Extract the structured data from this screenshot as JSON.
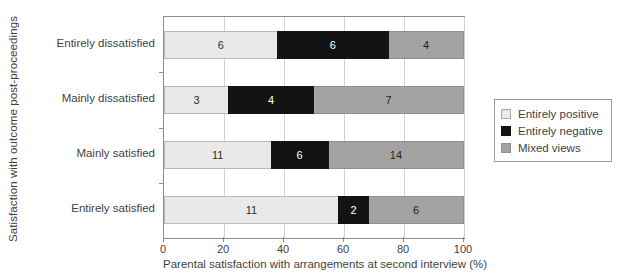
{
  "chart_data": {
    "type": "bar",
    "orientation": "horizontal",
    "stacked": true,
    "stack_unit": "count",
    "title": "",
    "xlabel": "Parental satisfaction with arrangements at second interview (%)",
    "ylabel": "Satisfaction with outcome post-proceedings",
    "xlim": [
      0,
      100
    ],
    "xticks": [
      0,
      20,
      40,
      60,
      80,
      100
    ],
    "xtick_labels": [
      "0",
      "20",
      "40",
      "60",
      "80",
      "100"
    ],
    "grid": true,
    "legend_position": "right",
    "categories": [
      "Entirely dissatisfied",
      "Mainly dissatisfied",
      "Mainly satisfied",
      "Entirely satisfied"
    ],
    "series": [
      {
        "name": "Entirely positive",
        "color": "#e9e9e9",
        "values": [
          6,
          3,
          11,
          11
        ]
      },
      {
        "name": "Entirely negative",
        "color": "#131313",
        "values": [
          6,
          4,
          6,
          2
        ]
      },
      {
        "name": "Mixed views",
        "color": "#a3a3a3",
        "values": [
          4,
          7,
          14,
          6
        ]
      }
    ],
    "bar_labels": [
      [
        "6",
        "6",
        "4"
      ],
      [
        "3",
        "4",
        "7"
      ],
      [
        "11",
        "6",
        "14"
      ],
      [
        "11",
        "2",
        "6"
      ]
    ],
    "row_totals": [
      16,
      14,
      31,
      19
    ],
    "percent_segments": [
      [
        37.5,
        37.5,
        25.0
      ],
      [
        21.4,
        28.6,
        50.0
      ],
      [
        35.5,
        19.4,
        45.2
      ],
      [
        57.9,
        10.5,
        31.6
      ]
    ]
  },
  "legend": {
    "items": [
      {
        "label": "Entirely positive",
        "swatch": "swatch-entirely-positive"
      },
      {
        "label": "Entirely negative",
        "swatch": "swatch-entirely-negative"
      },
      {
        "label": "Mixed views",
        "swatch": "swatch-mixed-views"
      }
    ]
  }
}
